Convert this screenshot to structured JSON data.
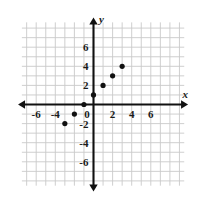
{
  "figure": {
    "kind": "coordinate-plane-scatter-plot",
    "background_color": "#ffffff",
    "grid_color": "#c9c9c9",
    "axis_color": "#111111",
    "point_color": "#111111"
  },
  "axes": {
    "x_axis_name": "x",
    "y_axis_name": "y",
    "x_tick_labels": [
      "-6",
      "-4",
      "0",
      "2",
      "4",
      "6"
    ],
    "x_tick_values": [
      -6,
      -4,
      0,
      2,
      4,
      6
    ],
    "y_tick_labels": [
      "6",
      "4",
      "2",
      "0",
      "-2",
      "-4",
      "-6"
    ],
    "y_tick_values": [
      6,
      4,
      2,
      0,
      -2,
      -4,
      -6
    ],
    "origin_label": "0"
  },
  "chart_data": {
    "type": "scatter",
    "title": "",
    "subtitle": "",
    "xlabel": "x",
    "ylabel": "y",
    "xlim": [
      -8.5,
      8.5
    ],
    "ylim": [
      -8.5,
      8.5
    ],
    "xticks": [
      -6,
      -4,
      0,
      2,
      4,
      6
    ],
    "yticks": [
      6,
      4,
      2,
      0,
      -2,
      -4,
      -6
    ],
    "grid": true,
    "grid_step": 1,
    "legend": null,
    "legend_position": "none",
    "annotations": [],
    "series": [
      {
        "name": "plotted points",
        "points": [
          {
            "x": -3,
            "y": -2
          },
          {
            "x": -2,
            "y": -1
          },
          {
            "x": -1,
            "y": 0
          },
          {
            "x": 0,
            "y": 1
          },
          {
            "x": 1,
            "y": 2
          },
          {
            "x": 2,
            "y": 3
          },
          {
            "x": 3,
            "y": 4
          }
        ]
      }
    ]
  }
}
